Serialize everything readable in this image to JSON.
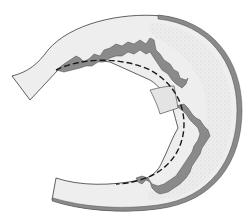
{
  "diagram": {
    "type": "anatomical-illustration",
    "colors": {
      "background": "#ffffff",
      "body_fill": "#ededed",
      "stipple": "#b8b8b8",
      "rim": "#8a8a8a",
      "jagged_edge": "#7a7a7a",
      "outline": "#3a3a3a",
      "dashed_line": "#1a1a1a"
    },
    "elements": [
      "outer-rim",
      "stippled-band",
      "jagged-inner-border",
      "detached-fragment",
      "dashed-contour"
    ]
  }
}
